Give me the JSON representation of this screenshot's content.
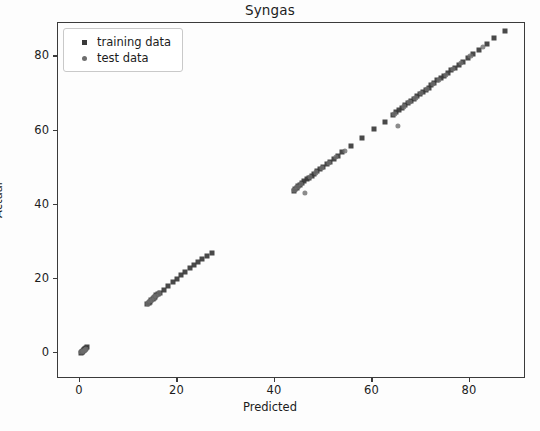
{
  "chart_data": {
    "type": "scatter",
    "title": "Syngas",
    "xlabel": "Predicted",
    "ylabel": "Actual",
    "xlim": [
      -4.5,
      91.5
    ],
    "ylim": [
      -7.0,
      89.0
    ],
    "xticks": [
      0,
      20,
      40,
      60,
      80
    ],
    "yticks": [
      0,
      20,
      40,
      60,
      80
    ],
    "xticklabels": [
      "0",
      "20",
      "40",
      "60",
      "80"
    ],
    "yticklabels": [
      "0",
      "20",
      "40",
      "60",
      "80"
    ],
    "grid": false,
    "legend_position": "upper left",
    "series": [
      {
        "name": "training data",
        "marker": "square",
        "color": "#3a3a3a",
        "points": [
          [
            0.2,
            0.1
          ],
          [
            0.4,
            0.4
          ],
          [
            0.6,
            0.6
          ],
          [
            0.8,
            0.9
          ],
          [
            1.0,
            1.1
          ],
          [
            1.2,
            1.3
          ],
          [
            1.4,
            1.5
          ],
          [
            0.9,
            0.7
          ],
          [
            0.5,
            0.3
          ],
          [
            1.1,
            1.0
          ],
          [
            13.8,
            13.2
          ],
          [
            14.1,
            13.6
          ],
          [
            14.3,
            13.9
          ],
          [
            14.6,
            14.2
          ],
          [
            14.9,
            14.6
          ],
          [
            15.1,
            14.9
          ],
          [
            15.4,
            15.2
          ],
          [
            15.7,
            15.6
          ],
          [
            16.0,
            15.9
          ],
          [
            16.4,
            16.3
          ],
          [
            17.2,
            17.1
          ],
          [
            18.1,
            18.2
          ],
          [
            19.0,
            19.2
          ],
          [
            19.9,
            20.1
          ],
          [
            20.8,
            21.0
          ],
          [
            21.6,
            21.9
          ],
          [
            22.5,
            22.8
          ],
          [
            23.4,
            23.7
          ],
          [
            24.2,
            24.5
          ],
          [
            25.1,
            25.4
          ],
          [
            26.0,
            26.2
          ],
          [
            27.0,
            27.1
          ],
          [
            43.9,
            43.8
          ],
          [
            44.2,
            44.2
          ],
          [
            44.5,
            44.6
          ],
          [
            44.8,
            45.0
          ],
          [
            45.2,
            45.4
          ],
          [
            45.6,
            45.9
          ],
          [
            46.0,
            46.3
          ],
          [
            46.5,
            46.8
          ],
          [
            47.0,
            47.3
          ],
          [
            47.5,
            47.8
          ],
          [
            48.1,
            48.4
          ],
          [
            48.7,
            49.0
          ],
          [
            49.3,
            49.6
          ],
          [
            49.9,
            50.2
          ],
          [
            50.6,
            50.9
          ],
          [
            51.3,
            51.6
          ],
          [
            52.1,
            52.4
          ],
          [
            52.9,
            53.2
          ],
          [
            53.8,
            54.1
          ],
          [
            55.6,
            55.8
          ],
          [
            57.8,
            57.9
          ],
          [
            60.4,
            60.3
          ],
          [
            62.5,
            62.4
          ],
          [
            64.2,
            64.2
          ],
          [
            64.9,
            65.0
          ],
          [
            65.5,
            65.6
          ],
          [
            66.1,
            66.2
          ],
          [
            66.7,
            66.8
          ],
          [
            67.3,
            67.4
          ],
          [
            67.9,
            68.0
          ],
          [
            68.5,
            68.6
          ],
          [
            69.1,
            69.2
          ],
          [
            69.7,
            69.8
          ],
          [
            70.3,
            70.4
          ],
          [
            70.9,
            71.0
          ],
          [
            71.5,
            71.6
          ],
          [
            72.1,
            72.2
          ],
          [
            72.7,
            72.8
          ],
          [
            73.3,
            73.5
          ],
          [
            74.0,
            74.1
          ],
          [
            74.7,
            74.8
          ],
          [
            75.4,
            75.5
          ],
          [
            76.1,
            76.2
          ],
          [
            76.9,
            77.0
          ],
          [
            77.7,
            77.8
          ],
          [
            78.6,
            78.6
          ],
          [
            79.6,
            79.6
          ],
          [
            80.7,
            80.6
          ],
          [
            81.9,
            81.8
          ],
          [
            83.4,
            83.3
          ],
          [
            85.0,
            84.9
          ],
          [
            87.2,
            86.9
          ]
        ]
      },
      {
        "name": "test data",
        "marker": "circle",
        "color": "#6e6e6e",
        "points": [
          [
            0.3,
            0.2
          ],
          [
            0.7,
            0.5
          ],
          [
            1.0,
            0.8
          ],
          [
            1.3,
            1.2
          ],
          [
            14.0,
            13.4
          ],
          [
            14.4,
            14.0
          ],
          [
            14.8,
            14.4
          ],
          [
            15.2,
            15.0
          ],
          [
            15.6,
            15.4
          ],
          [
            16.2,
            16.1
          ],
          [
            44.0,
            44.0
          ],
          [
            44.6,
            44.8
          ],
          [
            45.4,
            45.6
          ],
          [
            46.2,
            43.2
          ],
          [
            47.2,
            47.5
          ],
          [
            48.4,
            48.7
          ],
          [
            49.6,
            49.9
          ],
          [
            51.0,
            51.2
          ],
          [
            52.5,
            52.8
          ],
          [
            54.3,
            54.5
          ],
          [
            64.5,
            64.5
          ],
          [
            65.3,
            61.2
          ],
          [
            66.4,
            66.5
          ],
          [
            67.6,
            67.7
          ],
          [
            68.8,
            68.9
          ],
          [
            70.0,
            70.1
          ],
          [
            71.2,
            71.3
          ],
          [
            72.4,
            72.5
          ],
          [
            73.6,
            73.7
          ],
          [
            75.0,
            75.1
          ],
          [
            76.5,
            76.6
          ],
          [
            78.1,
            78.2
          ],
          [
            80.1,
            80.1
          ],
          [
            82.6,
            82.5
          ]
        ]
      }
    ]
  },
  "axis": {
    "title": "Syngas",
    "xlabel": "Predicted",
    "ylabel": "Actual"
  },
  "legend": {
    "items": [
      {
        "label": "training data",
        "marker": "square-marker-icon"
      },
      {
        "label": "test data",
        "marker": "circle-marker-icon"
      }
    ]
  },
  "style": {
    "train_color": "#3a3a3a",
    "test_color": "#6e6e6e",
    "axes_color": "#3b3b3b",
    "text_color": "#1c1c1c",
    "background": "#ffffff"
  }
}
